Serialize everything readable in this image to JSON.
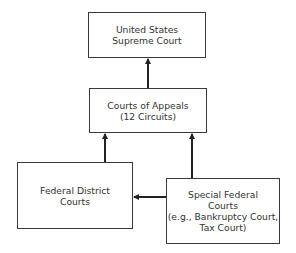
{
  "diagram": {
    "type": "hierarchy",
    "nodes": [
      {
        "id": "supreme",
        "lines": [
          "United States",
          "Supreme Court"
        ]
      },
      {
        "id": "appeals",
        "lines": [
          "Courts of Appeals",
          "(12 Circuits)"
        ]
      },
      {
        "id": "district",
        "lines": [
          "Federal District",
          "Courts"
        ]
      },
      {
        "id": "special",
        "lines": [
          "Special Federal",
          "Courts",
          "(e.g., Bankruptcy Court,",
          "Tax Court)"
        ]
      }
    ],
    "edges": [
      {
        "from": "appeals",
        "to": "supreme"
      },
      {
        "from": "district",
        "to": "appeals"
      },
      {
        "from": "special",
        "to": "appeals"
      },
      {
        "from": "special",
        "to": "district"
      }
    ]
  }
}
